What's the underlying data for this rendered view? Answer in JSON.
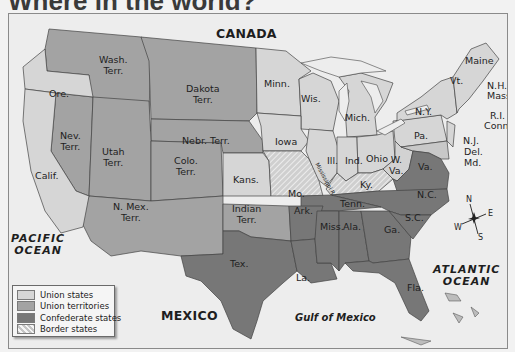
{
  "title": "Where in the world?",
  "colors": {
    "union_states": "#d6d6d6",
    "union_territories": "#a3a3a3",
    "confederate_states": "#777777",
    "border_states": "#c9c9c9",
    "water": "#ededed",
    "foreign_land": "#ebebeb"
  },
  "map": {
    "places": {
      "canada": "CANADA",
      "mexico": "MEXICO",
      "pacific": [
        "PACIFIC",
        "OCEAN"
      ],
      "atlantic": [
        "ATLANTIC",
        "OCEAN"
      ],
      "gulf": "Gulf of Mexico",
      "river": "Mississippi R."
    },
    "union_states": [
      "Ore.",
      "Calif.",
      "Minn.",
      "Wis.",
      "Iowa",
      "Mich.",
      "Ill.",
      "Ind.",
      "Ohio",
      "Kans.",
      "Pa.",
      "N.Y.",
      "Vt.",
      "Maine",
      "N.H.",
      "Mass.",
      "R.I.",
      "Conn.",
      "N.J."
    ],
    "union_territories": [
      "Wash. Terr.",
      "Dakota Terr.",
      "Nebr. Terr.",
      "Nev. Terr.",
      "Utah Terr.",
      "Colo. Terr.",
      "N. Mex. Terr.",
      "Indian Terr."
    ],
    "confederate_states": [
      "Tex.",
      "Ark.",
      "La.",
      "Miss.",
      "Ala.",
      "Tenn.",
      "Ga.",
      "Fla.",
      "S.C.",
      "N.C.",
      "Va."
    ],
    "border_states": [
      "Mo.",
      "Ky.",
      "W. Va.",
      "Md.",
      "Del."
    ],
    "labels": {
      "wash": [
        "Wash.",
        "Terr."
      ],
      "ore": "Ore.",
      "dakota": [
        "Dakota",
        "Terr."
      ],
      "minn": "Minn.",
      "wis": "Wis.",
      "mich": "Mich.",
      "nebr": "Nebr. Terr.",
      "iowa": "Iowa",
      "nev": [
        "Nev.",
        "Terr."
      ],
      "utah": [
        "Utah",
        "Terr."
      ],
      "colo": [
        "Colo.",
        "Terr."
      ],
      "calif": "Calif.",
      "kans": "Kans.",
      "mo": "Mo.",
      "ill": "Ill.",
      "ind": "Ind.",
      "ohio": "Ohio",
      "ky": "Ky.",
      "wva": [
        "W.",
        "Va."
      ],
      "va": "Va.",
      "pa": "Pa.",
      "ny": "N.Y.",
      "vt": "Vt.",
      "maine": "Maine",
      "nh": "N.H.",
      "mass": "Mass.",
      "ri": "R.I.",
      "conn": "Conn.",
      "nj": "N.J.",
      "del": "Del.",
      "md": "Md.",
      "nmex": [
        "N. Mex.",
        "Terr."
      ],
      "indian": [
        "Indian",
        "Terr."
      ],
      "ark": "Ark.",
      "tenn": "Tenn.",
      "nc": "N.C.",
      "sc": "S.C.",
      "miss": "Miss.",
      "ala": "Ala.",
      "ga": "Ga.",
      "tex": "Tex.",
      "la": "La.",
      "fla": "Fla."
    }
  },
  "compass": {
    "n": "N",
    "s": "S",
    "e": "E",
    "w": "W"
  },
  "legend": {
    "items": [
      {
        "label": "Union states",
        "color": "#d6d6d6"
      },
      {
        "label": "Union territories",
        "color": "#a3a3a3"
      },
      {
        "label": "Confederate states",
        "color": "#777777"
      },
      {
        "label": "Border states",
        "color": "#c9c9c9",
        "pattern": "hatched"
      }
    ]
  }
}
